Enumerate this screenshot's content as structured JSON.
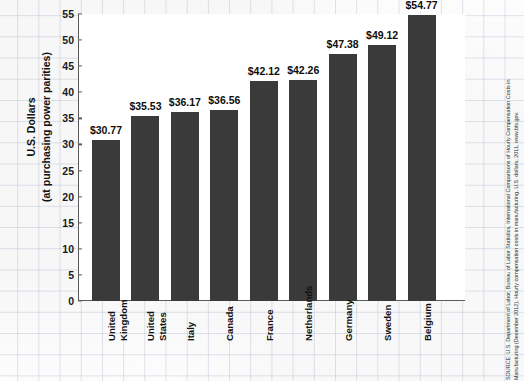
{
  "chart_data": {
    "type": "bar",
    "title": "",
    "subtitle": "",
    "xlabel": "",
    "ylabel": "U.S. Dollars (at purchasing power parities)",
    "ylim": [
      0,
      55
    ],
    "ytick_step": 5,
    "yticks": [
      0,
      5,
      10,
      15,
      20,
      25,
      30,
      35,
      40,
      45,
      50,
      55
    ],
    "grid": false,
    "legend": "none",
    "value_prefix": "$",
    "categories": [
      "United Kingdom",
      "United States",
      "Italy",
      "Canada",
      "France",
      "Netherlands",
      "Germany",
      "Sweden",
      "Belgium"
    ],
    "values": [
      30.77,
      35.53,
      36.17,
      36.56,
      42.12,
      42.26,
      47.38,
      49.12,
      54.77
    ],
    "value_labels": [
      "$30.77",
      "$35.53",
      "$36.17",
      "$36.56",
      "$42.12",
      "$42.26",
      "$47.38",
      "$49.12",
      "$54.77"
    ],
    "bar_color": "#3a3a3a",
    "axis_color": "#5a5a5a",
    "plot_background": "#ffffff",
    "page_background": "#fdfdfd",
    "grid_paper_color": "#96a5c3"
  },
  "axis": {
    "y_title_line1": "U.S. Dollars",
    "y_title_line2": "(at purchasing power parities)",
    "tick_labels": [
      "55",
      "50",
      "45",
      "40",
      "35",
      "30",
      "25",
      "20",
      "15",
      "10",
      "5",
      "0"
    ],
    "category_labels": [
      {
        "lines": [
          "United",
          "Kingdom"
        ]
      },
      {
        "lines": [
          "United",
          "States"
        ]
      },
      {
        "lines": [
          "Italy"
        ]
      },
      {
        "lines": [
          "Canada"
        ]
      },
      {
        "lines": [
          "France"
        ]
      },
      {
        "lines": [
          "Netherlands"
        ]
      },
      {
        "lines": [
          "Germany"
        ]
      },
      {
        "lines": [
          "Sweden"
        ]
      },
      {
        "lines": [
          "Belgium"
        ]
      }
    ]
  },
  "source": {
    "line1": "SOURCE: U.S. Department of Labor, Bureau of Labor Statistics, International Comparisons of Hourly Compensation Costs in",
    "line2": "Manufacturing (December 2012), Hourly compensation costs in manufacturing, U.S. dollars, 2011, www.bls.gov."
  }
}
